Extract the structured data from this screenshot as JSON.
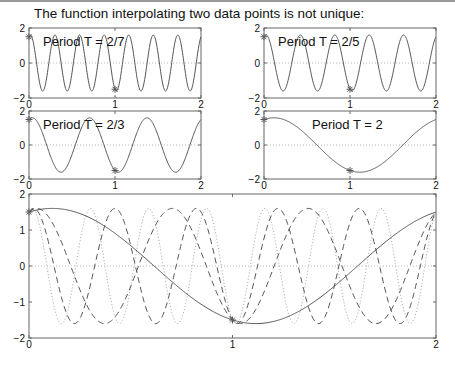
{
  "title": "The function interpolating two data points is not unique:",
  "chart_data": [
    {
      "type": "line",
      "title": "Period T = 2/7",
      "period": 0.2857142857,
      "xlim": [
        0,
        2
      ],
      "ylim": [
        -2,
        2
      ],
      "xticks": [
        "0",
        "1",
        "2"
      ],
      "yticks": [
        "-2",
        "0",
        "2"
      ],
      "amplitude": 1.6,
      "phase": 0.36,
      "data_points": [
        [
          0,
          1.5
        ],
        [
          1,
          -1.5
        ]
      ],
      "line_style": "solid"
    },
    {
      "type": "line",
      "title": "Period T = 2/5",
      "period": 0.4,
      "xlim": [
        0,
        2
      ],
      "ylim": [
        -2,
        2
      ],
      "xticks": [
        "0",
        "1",
        "2"
      ],
      "yticks": [
        "-2",
        "0",
        "2"
      ],
      "amplitude": 1.6,
      "phase": 0.36,
      "data_points": [
        [
          0,
          1.5
        ],
        [
          1,
          -1.5
        ]
      ],
      "line_style": "solid"
    },
    {
      "type": "line",
      "title": "Period T = 2/3",
      "period": 0.6666666667,
      "xlim": [
        0,
        2
      ],
      "ylim": [
        -2,
        2
      ],
      "xticks": [
        "0",
        "1",
        "2"
      ],
      "yticks": [
        "-2",
        "0",
        "2"
      ],
      "amplitude": 1.6,
      "phase": 0.36,
      "data_points": [
        [
          0,
          1.5
        ],
        [
          1,
          -1.5
        ]
      ],
      "line_style": "solid"
    },
    {
      "type": "line",
      "title": "Period T = 2",
      "period": 2,
      "xlim": [
        0,
        2
      ],
      "ylim": [
        -2,
        2
      ],
      "xticks": [
        "0",
        "1",
        "2"
      ],
      "yticks": [
        "-2",
        "0",
        "2"
      ],
      "amplitude": 1.6,
      "phase": 0.36,
      "data_points": [
        [
          0,
          1.5
        ],
        [
          1,
          -1.5
        ]
      ],
      "line_style": "solid"
    },
    {
      "type": "line",
      "title": "",
      "xlim": [
        0,
        2
      ],
      "ylim": [
        -2,
        2
      ],
      "xticks": [
        "0",
        "1",
        "2"
      ],
      "yticks": [
        "-2",
        "-1",
        "0",
        "1",
        "2"
      ],
      "data_points": [
        [
          0,
          1.5
        ],
        [
          1,
          -1.5
        ]
      ],
      "series": [
        {
          "name": "T = 2",
          "period": 2,
          "amplitude": 1.6,
          "phase": 0.36,
          "line_style": "solid",
          "color": "#555555"
        },
        {
          "name": "T = 2/3",
          "period": 0.6666666667,
          "amplitude": 1.6,
          "phase": 0.36,
          "line_style": "dashed",
          "color": "#555555"
        },
        {
          "name": "T = 2/5",
          "period": 0.4,
          "amplitude": 1.6,
          "phase": 0.36,
          "line_style": "dashed",
          "color": "#555555"
        },
        {
          "name": "T = 2/7",
          "period": 0.2857142857,
          "amplitude": 1.6,
          "phase": 0.36,
          "line_style": "dotted",
          "color": "#b0b0b0"
        }
      ]
    }
  ],
  "colors": {
    "axes": "#666666",
    "curve": "#555555",
    "zero_line": "#b8b8b8",
    "marker": "#555555"
  }
}
